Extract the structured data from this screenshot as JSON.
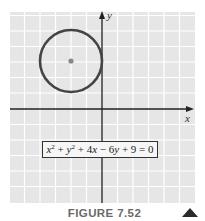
{
  "figure": {
    "caption": "FIGURE 7.52",
    "nav_icon": "triangle-up-icon",
    "equation": {
      "text": "x² + y² + 4x − 6y + 9 = 0",
      "parts": {
        "x": "x",
        "x_exp": "2",
        "plus1": " + ",
        "y": "y",
        "y_exp": "2",
        "rest": " + 4",
        "x2": "x",
        "minus": " − 6",
        "y2": "y",
        "tail": " + 9 = 0"
      }
    },
    "axes": {
      "x_label": "x",
      "y_label": "y"
    },
    "circle": {
      "center": [
        -2,
        3
      ],
      "radius": 2
    },
    "colors": {
      "grid_background": "#e6e6e6",
      "grid_lines": "#ffffff",
      "axis": "#222222",
      "circle_stroke": "#444444",
      "center_dot": "#888888",
      "caption": "#6a6a6a"
    }
  }
}
